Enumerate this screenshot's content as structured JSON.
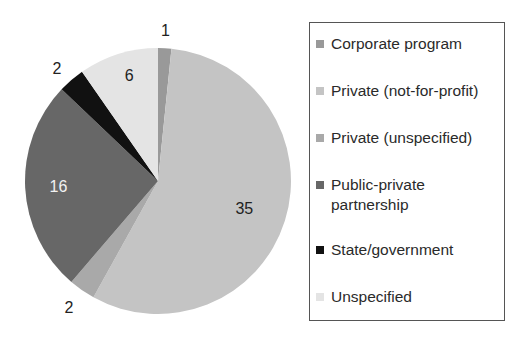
{
  "chart_data": {
    "type": "pie",
    "title": "",
    "start_angle_deg": 0,
    "direction": "clockwise",
    "categories": [
      "Corporate program",
      "Private (not-for-profit)",
      "Private (unspecified)",
      "Public-private partnership",
      "State/government",
      "Unspecified"
    ],
    "values": [
      1,
      35,
      2,
      16,
      2,
      6
    ],
    "colors": [
      "#999999",
      "#c4c4c4",
      "#a9a9a9",
      "#676767",
      "#111111",
      "#e4e4e4"
    ],
    "data_labels": [
      "1",
      "35",
      "2",
      "16",
      "2",
      "6"
    ],
    "legend_position": "right"
  },
  "legend": {
    "items": [
      {
        "label": "Corporate program",
        "color": "#999999"
      },
      {
        "label": "Private (not-for-profit)",
        "color": "#c4c4c4"
      },
      {
        "label": "Private (unspecified)",
        "color": "#a9a9a9"
      },
      {
        "label": "Public-private\npartnership",
        "color": "#676767"
      },
      {
        "label": "State/government",
        "color": "#111111"
      },
      {
        "label": "Unspecified",
        "color": "#e4e4e4"
      }
    ]
  }
}
